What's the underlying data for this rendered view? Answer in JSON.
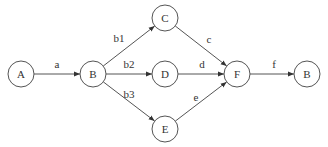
{
  "diagram": {
    "type": "directed-graph",
    "nodes": [
      {
        "id": "A",
        "label": "A",
        "x": 21,
        "y": 74
      },
      {
        "id": "B1",
        "label": "B",
        "x": 93,
        "y": 74
      },
      {
        "id": "C",
        "label": "C",
        "x": 165,
        "y": 18
      },
      {
        "id": "D",
        "label": "D",
        "x": 165,
        "y": 74
      },
      {
        "id": "E",
        "label": "E",
        "x": 165,
        "y": 129
      },
      {
        "id": "F",
        "label": "F",
        "x": 237,
        "y": 74
      },
      {
        "id": "B2",
        "label": "B",
        "x": 307,
        "y": 74
      }
    ],
    "edges": [
      {
        "from": "A",
        "to": "B1",
        "label": "a",
        "lx": 57,
        "ly": 68
      },
      {
        "from": "B1",
        "to": "C",
        "label": "b1",
        "lx": 119,
        "ly": 42
      },
      {
        "from": "B1",
        "to": "D",
        "label": "b2",
        "lx": 129,
        "ly": 68
      },
      {
        "from": "B1",
        "to": "E",
        "label": "b3",
        "lx": 129,
        "ly": 98
      },
      {
        "from": "C",
        "to": "F",
        "label": "c",
        "lx": 209,
        "ly": 43
      },
      {
        "from": "D",
        "to": "F",
        "label": "d",
        "lx": 202,
        "ly": 68
      },
      {
        "from": "E",
        "to": "F",
        "label": "e",
        "lx": 196,
        "ly": 101
      },
      {
        "from": "F",
        "to": "B2",
        "label": "f",
        "lx": 274,
        "ly": 68
      }
    ],
    "node_radius": 13,
    "stroke_color": "#555555"
  }
}
